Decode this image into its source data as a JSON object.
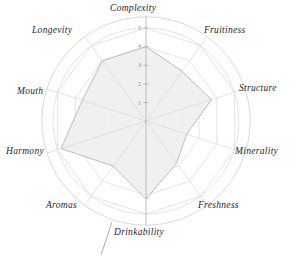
{
  "chart_data": {
    "type": "radar",
    "title": "",
    "subtitle": "",
    "xlabel": "",
    "ylabel": "",
    "grid": true,
    "legend_position": "none",
    "rlim": [
      0,
      5
    ],
    "tick_labels": [
      "1",
      "2",
      "3",
      "4",
      "5"
    ],
    "tick_values": [
      1,
      2,
      3,
      4,
      5
    ],
    "categories": [
      "Complexity",
      "Fruitiness",
      "Structure",
      "Minerality",
      "Freshness",
      "Drinkability",
      "Aromas",
      "Harmony",
      "Mouth",
      "Longevity"
    ],
    "series": [
      {
        "name": "Tasting profile",
        "values": [
          4.0,
          3.3,
          3.7,
          2.3,
          2.8,
          4.2,
          3.0,
          4.8,
          3.6,
          4.0
        ]
      }
    ],
    "colors": {
      "grid": "#d9d9d9",
      "outer_ring": "#cfcfcf",
      "series_stroke": "#b5b5b5",
      "series_fill": "#ededed",
      "label_text": "#1f1f1f",
      "tick_text": "#8d8d8d"
    }
  },
  "labels": {
    "complexity": "Complexity",
    "fruitiness": "Fruitiness",
    "structure": "Structure",
    "minerality": "Minerality",
    "freshness": "Freshness",
    "drinkability": "Drinkability",
    "aromas": "Aromas",
    "harmony": "Harmony",
    "mouth": "Mouth",
    "longevity": "Longevity"
  },
  "ticks": {
    "t1": "1",
    "t2": "2",
    "t3": "3",
    "t4": "4",
    "t5": "5"
  }
}
